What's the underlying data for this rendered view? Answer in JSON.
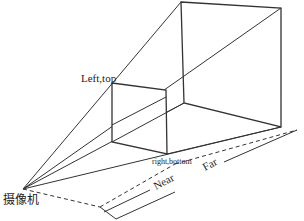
{
  "diagram": {
    "labels": {
      "left_top": "Left,top",
      "right_bottom": "right,bottom",
      "near": "Near",
      "far": "Far",
      "camera": "摄像机"
    },
    "colors": {
      "line": "#333333",
      "background": "#ffffff"
    }
  }
}
